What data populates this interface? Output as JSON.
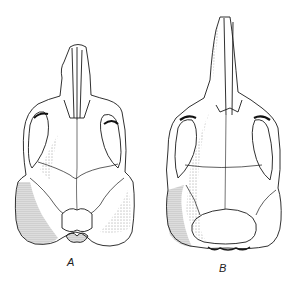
{
  "figure": {
    "panels": [
      {
        "id": "A",
        "label": "A"
      },
      {
        "id": "B",
        "label": "B"
      }
    ]
  },
  "colors": {
    "background": "#ffffff",
    "ink": "#1a1a1a",
    "shade": "#8a8a8a"
  }
}
